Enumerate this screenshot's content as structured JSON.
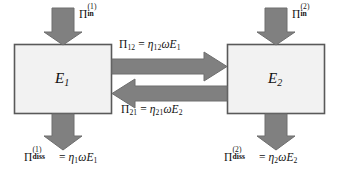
{
  "diagram": {
    "type": "energy-flow-block-diagram",
    "colors": {
      "arrow_fill": "#808080",
      "arrow_stroke": "#6b6b6b",
      "box_fill": "#f2f2f2",
      "box_stroke": "#595959",
      "background": "#ffffff",
      "text": "#111111"
    },
    "boxes": [
      {
        "id": "box-e1",
        "label_base": "E",
        "label_sub": "1",
        "x": 14,
        "y": 44,
        "width": 98,
        "height": 70
      },
      {
        "id": "box-e2",
        "label_base": "E",
        "label_sub": "2",
        "x": 227,
        "y": 44,
        "width": 98,
        "height": 70
      }
    ],
    "labels": {
      "input_1": {
        "symbol": "Π",
        "superscript": "(1)",
        "subscript": "in"
      },
      "input_2": {
        "symbol": "Π",
        "superscript": "(2)",
        "subscript": "in"
      },
      "transfer_12": {
        "symbol": "Π",
        "subscript": "12",
        "equals": "=",
        "coefficient_symbol": "η",
        "coefficient_subscript": "12",
        "omega": "ω",
        "energy_symbol": "E",
        "energy_subscript": "1",
        "full_text": "Π₁₂ = η₁₂ωE₁"
      },
      "transfer_21": {
        "symbol": "Π",
        "subscript": "21",
        "equals": "=",
        "coefficient_symbol": "η",
        "coefficient_subscript": "21",
        "omega": "ω",
        "energy_symbol": "E",
        "energy_subscript": "2",
        "full_text": "Π₂₁ = η₂₁ωE₂"
      },
      "dissipation_1": {
        "symbol": "Π",
        "superscript": "(1)",
        "subscript": "diss",
        "equals": "=",
        "coefficient_symbol": "η",
        "coefficient_subscript": "1",
        "omega": "ω",
        "energy_symbol": "E",
        "energy_subscript": "1",
        "full_text": "Πᵈⁱˢˢ⁽¹⁾ = η₁ωE₁"
      },
      "dissipation_2": {
        "symbol": "Π",
        "superscript": "(2)",
        "subscript": "diss",
        "equals": "=",
        "coefficient_symbol": "η",
        "coefficient_subscript": "2",
        "omega": "ω",
        "energy_symbol": "E",
        "energy_subscript": "2",
        "full_text": "Πᵈⁱˢˢ⁽²⁾ = η₂ωE₂"
      }
    },
    "arrows": [
      {
        "id": "arrow-input-1",
        "direction": "down",
        "from": "external",
        "to": "box-e1"
      },
      {
        "id": "arrow-input-2",
        "direction": "down",
        "from": "external",
        "to": "box-e2"
      },
      {
        "id": "arrow-transfer-12",
        "direction": "right",
        "from": "box-e1",
        "to": "box-e2"
      },
      {
        "id": "arrow-transfer-21",
        "direction": "left",
        "from": "box-e2",
        "to": "box-e1"
      },
      {
        "id": "arrow-dissipation-1",
        "direction": "down",
        "from": "box-e1",
        "to": "external"
      },
      {
        "id": "arrow-dissipation-2",
        "direction": "down",
        "from": "box-e2",
        "to": "external"
      }
    ]
  }
}
